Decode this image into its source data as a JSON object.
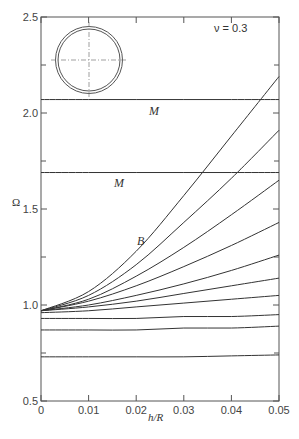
{
  "chart_data": {
    "type": "line",
    "title": "",
    "annotation": "ν = 0.3",
    "xlabel": "h/R",
    "ylabel": "Ω",
    "xlim": [
      0,
      0.05
    ],
    "ylim": [
      0.5,
      2.5
    ],
    "x_ticks": [
      "0",
      "0.01",
      "0.02",
      "0.03",
      "0.04",
      "0.05"
    ],
    "y_ticks": [
      "0.5",
      "1.0",
      "1.5",
      "2.0",
      "2.5"
    ],
    "grid": false,
    "legend": null,
    "inset": "ring cross-section (double circle with dash-dot centerlines)",
    "x": [
      0,
      0.01,
      0.02,
      0.03,
      0.04,
      0.05
    ],
    "series": [
      {
        "name": "B",
        "label": "B",
        "values": [
          0.97,
          1.07,
          1.28,
          1.57,
          1.88,
          2.19
        ]
      },
      {
        "name": "curve-2",
        "values": [
          0.97,
          1.05,
          1.21,
          1.43,
          1.66,
          1.91
        ]
      },
      {
        "name": "curve-3",
        "values": [
          0.97,
          1.03,
          1.15,
          1.3,
          1.47,
          1.65
        ]
      },
      {
        "name": "curve-4",
        "values": [
          0.97,
          1.02,
          1.1,
          1.2,
          1.31,
          1.43
        ]
      },
      {
        "name": "curve-5",
        "values": [
          0.97,
          1.0,
          1.05,
          1.11,
          1.18,
          1.26
        ]
      },
      {
        "name": "curve-6",
        "values": [
          0.97,
          0.99,
          1.02,
          1.06,
          1.1,
          1.14
        ]
      },
      {
        "name": "curve-7",
        "values": [
          0.96,
          0.97,
          0.99,
          1.01,
          1.03,
          1.05
        ]
      },
      {
        "name": "curve-8",
        "values": [
          0.93,
          0.93,
          0.93,
          0.94,
          0.94,
          0.95
        ]
      },
      {
        "name": "curve-9",
        "values": [
          0.87,
          0.87,
          0.87,
          0.88,
          0.88,
          0.89
        ]
      },
      {
        "name": "curve-10",
        "values": [
          0.73,
          0.73,
          0.73,
          0.73,
          0.735,
          0.74
        ]
      },
      {
        "name": "M-upper",
        "label": "M",
        "values": [
          2.07,
          2.07,
          2.07,
          2.07,
          2.07,
          2.07
        ]
      },
      {
        "name": "M-lower",
        "label": "M",
        "values": [
          1.69,
          1.69,
          1.69,
          1.69,
          1.69,
          1.69
        ]
      }
    ],
    "labels": {
      "M_upper": "M",
      "M_lower": "M",
      "B": "B"
    }
  }
}
